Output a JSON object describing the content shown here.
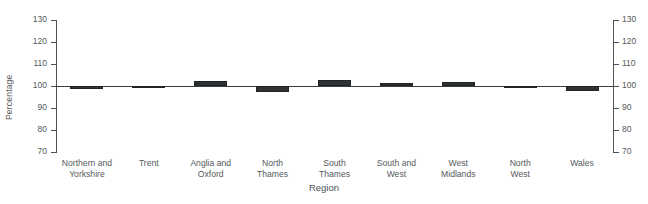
{
  "chart_data": {
    "type": "bar",
    "title": "",
    "subtitle": "",
    "xlabel": "Region",
    "ylabel": "Percentage",
    "ylim": [
      70,
      130
    ],
    "yticks": [
      70,
      80,
      90,
      100,
      110,
      120,
      130
    ],
    "ytick_labels": [
      "70",
      "80",
      "90",
      "100",
      "110",
      "120",
      "130"
    ],
    "baseline": 100,
    "grid": false,
    "legend": null,
    "dual_y_axis": true,
    "bar_color": "#2f3234",
    "axis_color": "#4d5154",
    "categories": [
      "Northern and\nYorkshire",
      "Trent",
      "Anglia and\nOxford",
      "North\nThames",
      "South\nThames",
      "South and\nWest",
      "West\nMidlands",
      "North\nWest",
      "Wales"
    ],
    "values": [
      98.5,
      99.3,
      102.5,
      97.3,
      102.8,
      101.2,
      102.0,
      99.0,
      97.8
    ]
  }
}
